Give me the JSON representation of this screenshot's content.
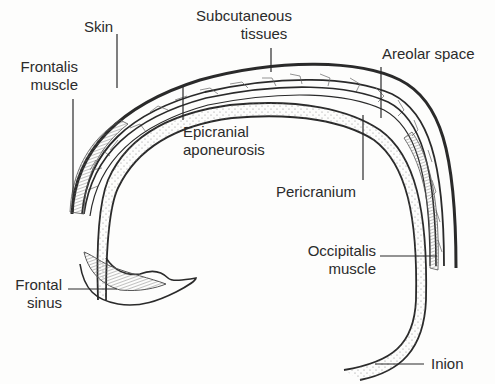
{
  "diagram": {
    "labels": [
      {
        "id": "skin",
        "lines": [
          "Skin"
        ]
      },
      {
        "id": "subcutaneous",
        "lines": [
          "Subcutaneous",
          "tissues"
        ]
      },
      {
        "id": "areolar",
        "lines": [
          "Areolar space"
        ]
      },
      {
        "id": "frontalis",
        "lines": [
          "Frontalis",
          "muscle"
        ]
      },
      {
        "id": "epicranial",
        "lines": [
          "Epicranial",
          "aponeurosis"
        ]
      },
      {
        "id": "pericranium",
        "lines": [
          "Pericranium"
        ]
      },
      {
        "id": "occipitalis",
        "lines": [
          "Occipitalis",
          "muscle"
        ]
      },
      {
        "id": "frontal-sinus",
        "lines": [
          "Frontal",
          "sinus"
        ]
      },
      {
        "id": "inion",
        "lines": [
          "Inion"
        ]
      }
    ],
    "colors": {
      "line": "#2a2a2a",
      "thin_line": "#555555",
      "stipple": "#8a8a8a",
      "sinus_fill": "#b8b8b8",
      "background": "#fdfdfc"
    }
  }
}
